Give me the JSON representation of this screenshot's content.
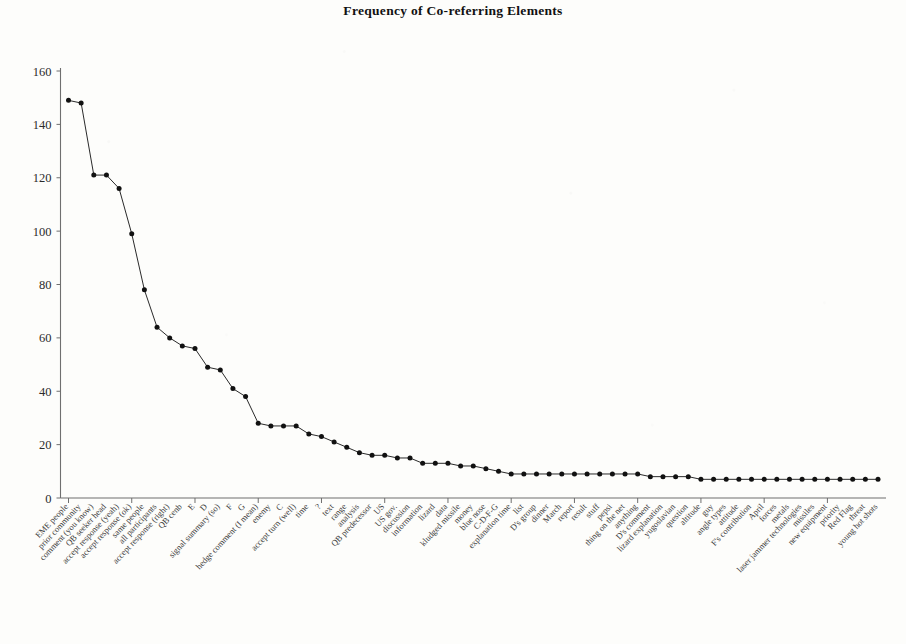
{
  "chart_data": {
    "type": "line",
    "title": "Frequency of Co-referring Elements",
    "xlabel": "",
    "ylabel": "",
    "ylim": [
      0,
      160
    ],
    "ytick_values": [
      0,
      20,
      40,
      60,
      80,
      100,
      120,
      140,
      160
    ],
    "grid": false,
    "legend": "none",
    "marker": "filled-circle",
    "categories": [
      "EME people",
      "prior community",
      "comment (you know)",
      "QB seeker head",
      "accept response (yeah)",
      "accept response (ok)",
      "same people",
      "all participants",
      "accept response (right)",
      "QB cenb",
      "E",
      "D",
      "signal summary (so)",
      "F",
      "G",
      "hedge comment (I mean)",
      "enemy",
      "C",
      "accept turn (well)",
      "time",
      "?",
      "text",
      "range",
      "analysis",
      "QB predecessor",
      "US",
      "US gov.",
      "discussion",
      "information",
      "lizard",
      "data",
      "kludged missile",
      "money",
      "blue nose",
      "C-D-F-G",
      "explanation time",
      "list",
      "D's group",
      "dinner",
      "March",
      "report",
      "result",
      "stuff",
      "pepsi",
      "thing on the net",
      "anything",
      "D's comment",
      "lizard explanation",
      "yugoslavian",
      "question",
      "altitude",
      "guy",
      "angle types",
      "attitude",
      "F's contribution",
      "April",
      "forces",
      "metals",
      "laser jammer technologies",
      "missiles",
      "new equipment",
      "priority",
      "Red Flag",
      "threat",
      "young hot shots"
    ],
    "values": [
      149,
      148,
      121,
      121,
      116,
      99,
      78,
      64,
      60,
      57,
      56,
      49,
      48,
      41,
      38,
      28,
      27,
      27,
      27,
      24,
      23,
      21,
      19,
      17,
      16,
      16,
      15,
      15,
      13,
      13,
      13,
      12,
      12,
      11,
      10,
      9,
      9,
      9,
      9,
      9,
      9,
      9,
      9,
      9,
      9,
      9,
      8,
      8,
      8,
      8,
      7,
      7,
      7,
      7,
      7,
      7,
      7,
      7,
      7,
      7,
      7,
      7,
      7,
      7,
      7
    ]
  }
}
